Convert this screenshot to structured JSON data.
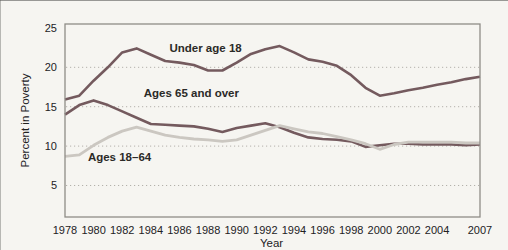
{
  "page": {
    "background": "#f6f5f1"
  },
  "chart_data": {
    "type": "line",
    "title": "",
    "xlabel": "Year",
    "ylabel": "Percent in Poverty",
    "xlim": [
      1978,
      2007
    ],
    "ylim": [
      1,
      25.5
    ],
    "grid": "horizontal dotted",
    "grid_values": [
      5,
      10,
      15,
      20
    ],
    "y_ticks": [
      {
        "value": 5,
        "label": "5"
      },
      {
        "value": 10,
        "label": "10"
      },
      {
        "value": 15,
        "label": "15"
      },
      {
        "value": 20,
        "label": "20"
      },
      {
        "value": 25,
        "label": "25"
      }
    ],
    "x_ticks": [
      {
        "year": 1978,
        "label": "1978"
      },
      {
        "year": 1980,
        "label": "1980"
      },
      {
        "year": 1982,
        "label": "1982"
      },
      {
        "year": 1984,
        "label": "1984"
      },
      {
        "year": 1986,
        "label": "1986"
      },
      {
        "year": 1988,
        "label": "1988"
      },
      {
        "year": 1990,
        "label": "1990"
      },
      {
        "year": 1992,
        "label": "1992"
      },
      {
        "year": 1994,
        "label": "1994"
      },
      {
        "year": 1996,
        "label": "1996"
      },
      {
        "year": 1998,
        "label": "1998"
      },
      {
        "year": 2000,
        "label": "2000"
      },
      {
        "year": 2002,
        "label": "2002"
      },
      {
        "year": 2004,
        "label": "2004"
      },
      {
        "year": 2007,
        "label": "2007"
      }
    ],
    "x": [
      1978,
      1979,
      1980,
      1981,
      1982,
      1983,
      1984,
      1985,
      1986,
      1987,
      1988,
      1989,
      1990,
      1991,
      1992,
      1993,
      1994,
      1995,
      1996,
      1997,
      1998,
      1999,
      2000,
      2001,
      2002,
      2003,
      2004,
      2005,
      2006,
      2007
    ],
    "series": [
      {
        "name": "Under age 18",
        "color": "#745a5e",
        "stroke_width": 2.6,
        "values": [
          15.9,
          16.4,
          18.3,
          20.0,
          21.9,
          22.4,
          21.6,
          20.8,
          20.6,
          20.3,
          19.6,
          19.6,
          20.6,
          21.7,
          22.3,
          22.7,
          21.9,
          21.0,
          20.7,
          20.2,
          19.0,
          17.4,
          16.4,
          16.7,
          17.1,
          17.4,
          17.8,
          18.1,
          18.5,
          18.8
        ]
      },
      {
        "name": "Ages 65 and over",
        "color": "#745a5e",
        "stroke_width": 2.6,
        "values": [
          14.0,
          15.2,
          15.8,
          15.2,
          14.4,
          13.6,
          12.8,
          12.7,
          12.6,
          12.5,
          12.2,
          11.8,
          12.3,
          12.6,
          12.9,
          12.4,
          11.7,
          11.1,
          10.9,
          10.8,
          10.6,
          9.9,
          10.1,
          10.3,
          10.3,
          10.2,
          10.2,
          10.2,
          10.1,
          10.2
        ]
      },
      {
        "name": "Ages 18–64",
        "color": "#cbc7c1",
        "stroke_width": 2.8,
        "values": [
          8.7,
          8.9,
          10.1,
          11.1,
          11.9,
          12.4,
          11.9,
          11.4,
          11.1,
          10.9,
          10.8,
          10.6,
          10.8,
          11.4,
          12.0,
          12.6,
          12.2,
          11.8,
          11.6,
          11.2,
          10.8,
          10.3,
          9.6,
          10.2,
          10.5,
          10.5,
          10.5,
          10.5,
          10.4,
          10.4
        ]
      }
    ],
    "annotations": [
      {
        "text": "Under age 18",
        "x": 1985.3,
        "y": 22.5
      },
      {
        "text": "Ages 65 and over",
        "x": 1983.5,
        "y": 16.7
      },
      {
        "text": "Ages 18–64",
        "x": 1979.6,
        "y": 8.6
      }
    ],
    "legend_position": "inline labels next to lines"
  }
}
